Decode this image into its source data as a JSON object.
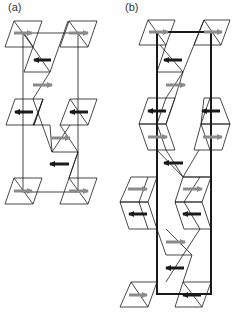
{
  "panels": [
    {
      "label": "(a)",
      "cell_border": "thin"
    },
    {
      "label": "(b)",
      "cell_border": "thick"
    }
  ],
  "colors": {
    "line": "#1a1a1a",
    "arrow_light": "#8a8a8a",
    "arrow_dark": "#1a1a1a",
    "background": "#ffffff"
  },
  "legend": {
    "arrow_light": "spin right (gray arrow)",
    "arrow_dark": "spin left (black arrow)"
  }
}
